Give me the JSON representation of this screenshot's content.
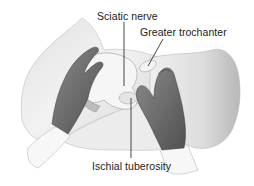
{
  "figure": {
    "colors": {
      "skin_light": "#ececec",
      "skin_mid": "#c8c8c8",
      "skin_shadow": "#9a9a9a",
      "hand": "#6e6e6e",
      "hand_dark": "#4a4a4a",
      "bone": "#f4f4f4",
      "sleeve": "#f8f8f8",
      "line": "#333333"
    },
    "labels": [
      {
        "id": "sciatic-nerve",
        "text": "Sciatic nerve"
      },
      {
        "id": "greater-trochanter",
        "text": "Greater trochanter"
      },
      {
        "id": "ischial-tuberosity",
        "text": "Ischial tuberosity"
      }
    ]
  }
}
